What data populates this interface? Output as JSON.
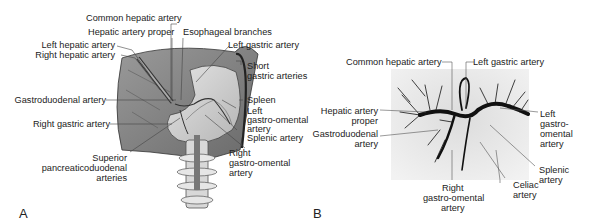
{
  "figure": {
    "panels": [
      {
        "letter": "A",
        "type": "illustration",
        "labels": {
          "common_hepatic": "Common hepatic artery",
          "hepatic_proper": "Hepatic artery proper",
          "esophageal": "Esophageal branches",
          "left_hepatic": "Left hepatic artery",
          "right_hepatic": "Right hepatic artery",
          "left_gastric": "Left gastric artery",
          "short_gastric_1": "Short",
          "short_gastric_2": "gastric arteries",
          "gastroduodenal": "Gastroduodenal artery",
          "spleen": "Spleen",
          "left_go_1": "Left",
          "left_go_2": "gastro-omental",
          "left_go_3": "artery",
          "right_gastric": "Right gastric artery",
          "splenic": "Splenic artery",
          "sup_pd_1": "Superior",
          "sup_pd_2": "pancreaticoduodenal",
          "sup_pd_3": "arteries",
          "right_go_1": "Right",
          "right_go_2": "gastro-omental",
          "right_go_3": "artery"
        }
      },
      {
        "letter": "B",
        "type": "angiogram",
        "labels": {
          "common_hepatic": "Common hepatic artery",
          "left_gastric": "Left gastric artery",
          "hepatic_proper_1": "Hepatic artery",
          "hepatic_proper_2": "proper",
          "gastroduodenal_1": "Gastroduodenal",
          "gastroduodenal_2": "artery",
          "left_go_1": "Left",
          "left_go_2": "gastro-",
          "left_go_3": "omental",
          "left_go_4": "artery",
          "right_go_1": "Right",
          "right_go_2": "gastro-omental",
          "right_go_3": "artery",
          "celiac_1": "Celiac",
          "celiac_2": "artery",
          "splenic_1": "Splenic",
          "splenic_2": "artery"
        }
      }
    ]
  }
}
